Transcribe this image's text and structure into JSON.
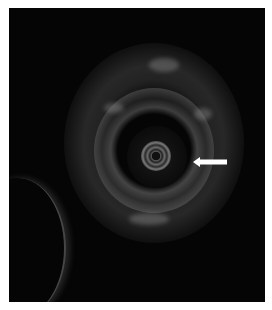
{
  "image": {
    "description": "Grayscale circular ultrasound cross-section with a central catheter ring and layered wall echoes",
    "colors": {
      "background": "#050505",
      "frame_border": "#ffffff",
      "arrow": "#ffffff"
    }
  },
  "annotation": {
    "type": "arrow",
    "direction": "left",
    "icon": "arrow-left-icon"
  }
}
